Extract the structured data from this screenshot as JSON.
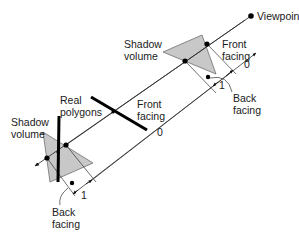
{
  "diagram": {
    "labels": {
      "viewpoint": "Viewpoint",
      "shadow_volume_top": "Shadow\nvolume",
      "shadow_volume_bottom": "Shadow\nvolume",
      "real_polygons": "Real\npolygons",
      "front_facing_top": "Front\nfacing",
      "front_facing_middle": "Front\nfacing",
      "back_facing_top": "Back\nfacing",
      "back_facing_bottom": "Back\nfacing"
    },
    "counts": {
      "top_zero": "0",
      "top_one": "1",
      "middle_zero": "0",
      "bottom_one": "1"
    },
    "colors": {
      "shadow_fill": "#c8c8c8",
      "shadow_stroke": "#6e6e6e",
      "line": "#333333",
      "polygon": "#000000",
      "background": "#ffffff"
    }
  }
}
